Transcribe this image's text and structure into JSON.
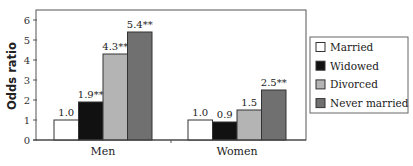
{
  "chart_data": {
    "type": "bar",
    "title": "",
    "xlabel": "",
    "ylabel": "Odds ratio",
    "ylim": [
      0,
      6
    ],
    "yticks": [
      "0",
      "1",
      "2",
      "3",
      "4",
      "5",
      "6"
    ],
    "categories": [
      "Men",
      "Women"
    ],
    "series": [
      {
        "name": "Married",
        "color": "#ffffff",
        "values": [
          1.0,
          1.0
        ],
        "labels": [
          "1.0",
          "1.0"
        ]
      },
      {
        "name": "Widowed",
        "color": "#111111",
        "values": [
          1.9,
          0.9
        ],
        "labels": [
          "1.9**",
          "0.9"
        ]
      },
      {
        "name": "Divorced",
        "color": "#b4b4b4",
        "values": [
          4.3,
          1.5
        ],
        "labels": [
          "4.3**",
          "1.5"
        ]
      },
      {
        "name": "Never married",
        "color": "#707070",
        "values": [
          5.4,
          2.5
        ],
        "labels": [
          "5.4**",
          "2.5**"
        ]
      }
    ],
    "grid": false,
    "legend": "right"
  }
}
